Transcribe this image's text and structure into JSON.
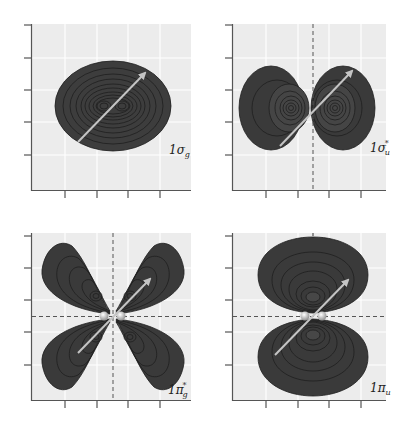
{
  "figure": {
    "panels": [
      {
        "id": "1sigma_g",
        "label_main": "1σ",
        "label_sub": "g",
        "label_sup": "",
        "nodal_vertical": false,
        "nodal_horizontal": false,
        "nuclei": false
      },
      {
        "id": "1sigma_u_star",
        "label_main": "1σ",
        "label_sub": "u",
        "label_sup": "*",
        "nodal_vertical": true,
        "nodal_horizontal": false,
        "nuclei": false
      },
      {
        "id": "1pi_g_star",
        "label_main": "1π",
        "label_sub": "g",
        "label_sup": "*",
        "nodal_vertical": true,
        "nodal_horizontal": true,
        "nuclei": true
      },
      {
        "id": "1pi_u",
        "label_main": "1π",
        "label_sub": "u",
        "label_sup": "",
        "nodal_vertical": false,
        "nodal_horizontal": true,
        "nuclei": true
      }
    ],
    "colors": {
      "panel_bg": "#ececec",
      "grid": "#ffffff",
      "lobe": "#3c3c3c",
      "contour": "#1a1a1a",
      "arrow": "#bdbdbd",
      "axis": "#555555",
      "nodal": "#555555"
    }
  },
  "labels": {
    "p1": {
      "main": "1σ",
      "sub": "g",
      "sup": ""
    },
    "p2": {
      "main": "1σ",
      "sub": "u",
      "sup": "*"
    },
    "p3": {
      "main": "1π",
      "sub": "g",
      "sup": "*"
    },
    "p4": {
      "main": "1π",
      "sub": "u",
      "sup": ""
    }
  }
}
